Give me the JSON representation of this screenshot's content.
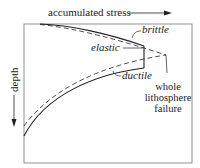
{
  "diagram": {
    "x_axis_label": "accumulated stress",
    "y_axis_label": "depth",
    "curve_labels": {
      "brittle": "brittle",
      "elastic": "elastic",
      "ductile": "ductile"
    },
    "failure_label_lines": [
      "whole",
      "lithosphere",
      "failure"
    ],
    "colors": {
      "line": "#222222",
      "frame": "#666666",
      "background": "#ffffff"
    }
  }
}
